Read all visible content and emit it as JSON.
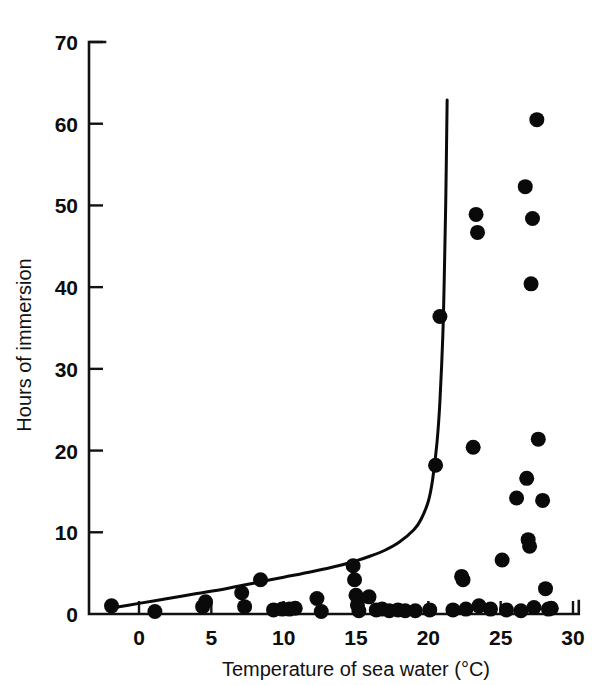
{
  "figure": {
    "background_color": "#ffffff",
    "ink_color": "#0a0a0a"
  },
  "axes": {
    "x_title": "Temperature of sea water (°C)",
    "y_title": "Hours of immersion",
    "x_ticks": [
      "0",
      "5",
      "10",
      "15",
      "20",
      "25",
      "30"
    ],
    "y_ticks": [
      "0",
      "10",
      "20",
      "30",
      "40",
      "50",
      "60",
      "70"
    ]
  },
  "chart_data": {
    "type": "scatter",
    "title": "",
    "xlabel": "Temperature of sea water (°C)",
    "ylabel": "Hours of immersion",
    "xlim": [
      -3.2,
      31.0
    ],
    "ylim": [
      -1.0,
      70.0
    ],
    "xticks": [
      0,
      5,
      10,
      15,
      20,
      25,
      30
    ],
    "yticks": [
      0,
      10,
      20,
      30,
      40,
      50,
      60,
      70
    ],
    "grid": false,
    "legend": null,
    "marker": "filled-circle",
    "marker_color": "#0a0a0a",
    "marker_radius_px": 7.5,
    "series": [
      {
        "name": "Observations",
        "type": "scatter",
        "points": [
          [
            -1.9,
            1.0
          ],
          [
            1.1,
            0.3
          ],
          [
            4.4,
            0.9
          ],
          [
            4.6,
            1.5
          ],
          [
            7.1,
            2.6
          ],
          [
            7.3,
            0.9
          ],
          [
            8.4,
            4.2
          ],
          [
            9.3,
            0.5
          ],
          [
            9.9,
            0.6
          ],
          [
            10.4,
            0.6
          ],
          [
            10.8,
            0.7
          ],
          [
            12.3,
            1.9
          ],
          [
            12.6,
            0.3
          ],
          [
            14.8,
            5.9
          ],
          [
            14.9,
            4.2
          ],
          [
            15.0,
            2.3
          ],
          [
            15.1,
            1.1
          ],
          [
            15.2,
            0.4
          ],
          [
            15.9,
            2.1
          ],
          [
            16.4,
            0.5
          ],
          [
            16.8,
            0.6
          ],
          [
            17.3,
            0.4
          ],
          [
            17.9,
            0.5
          ],
          [
            18.4,
            0.4
          ],
          [
            19.1,
            0.4
          ],
          [
            20.1,
            0.5
          ],
          [
            20.5,
            18.2
          ],
          [
            20.8,
            36.4
          ],
          [
            21.7,
            0.5
          ],
          [
            22.3,
            4.6
          ],
          [
            22.4,
            4.2
          ],
          [
            22.6,
            0.6
          ],
          [
            23.1,
            20.4
          ],
          [
            23.3,
            48.9
          ],
          [
            23.4,
            46.7
          ],
          [
            23.5,
            1.0
          ],
          [
            24.3,
            0.6
          ],
          [
            25.1,
            6.6
          ],
          [
            25.4,
            0.5
          ],
          [
            26.1,
            14.2
          ],
          [
            26.4,
            0.4
          ],
          [
            26.7,
            52.3
          ],
          [
            26.8,
            16.6
          ],
          [
            26.9,
            9.1
          ],
          [
            27.0,
            8.3
          ],
          [
            27.1,
            40.4
          ],
          [
            27.2,
            48.4
          ],
          [
            27.3,
            0.8
          ],
          [
            27.5,
            60.5
          ],
          [
            27.6,
            21.4
          ],
          [
            27.9,
            13.9
          ],
          [
            28.1,
            3.1
          ],
          [
            28.3,
            0.6
          ],
          [
            28.5,
            0.7
          ]
        ]
      },
      {
        "name": "Fitted curve",
        "type": "line",
        "points": [
          [
            -2.0,
            0.7
          ],
          [
            0.0,
            1.3
          ],
          [
            2.0,
            1.9
          ],
          [
            4.0,
            2.5
          ],
          [
            6.0,
            3.1
          ],
          [
            8.0,
            3.8
          ],
          [
            10.0,
            4.5
          ],
          [
            12.0,
            5.2
          ],
          [
            14.0,
            6.0
          ],
          [
            15.0,
            6.5
          ],
          [
            16.0,
            7.1
          ],
          [
            17.0,
            7.8
          ],
          [
            18.0,
            8.8
          ],
          [
            19.0,
            10.3
          ],
          [
            19.5,
            11.6
          ],
          [
            20.0,
            13.8
          ],
          [
            20.3,
            16.5
          ],
          [
            20.6,
            21.0
          ],
          [
            20.8,
            26.0
          ],
          [
            21.0,
            34.0
          ],
          [
            21.1,
            41.0
          ],
          [
            21.2,
            50.0
          ],
          [
            21.3,
            62.9
          ]
        ]
      }
    ]
  }
}
